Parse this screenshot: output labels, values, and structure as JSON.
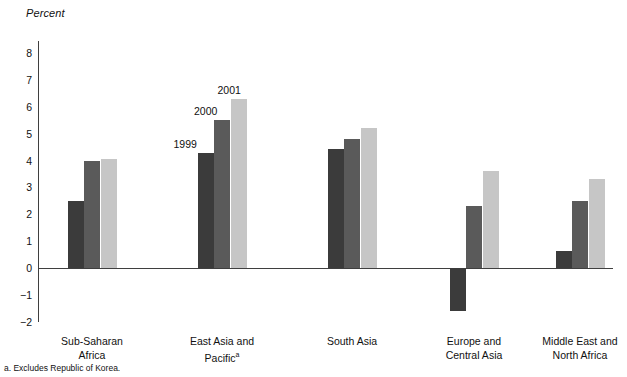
{
  "chart_data": {
    "type": "bar",
    "title": "",
    "ylabel": "Percent",
    "xlabel": "",
    "ylim": [
      -2,
      8
    ],
    "yticks": [
      8,
      7,
      6,
      5,
      4,
      3,
      2,
      1,
      0,
      -1,
      -2
    ],
    "ytick_labels": [
      "8",
      "7",
      "6",
      "5",
      "4",
      "3",
      "2",
      "1",
      "0",
      "−1",
      "−2"
    ],
    "grid": false,
    "legend_position": "inline-callout",
    "categories": [
      "Sub-Saharan Africa",
      "East Asia and Pacific",
      "South Asia",
      "Europe and Central Asia",
      "Middle East and North Africa"
    ],
    "category_lines": [
      [
        "Sub-Saharan",
        "Africa"
      ],
      [
        "East Asia and",
        "Pacific"
      ],
      [
        "South Asia",
        ""
      ],
      [
        "Europe and",
        "Central Asia"
      ],
      [
        "Middle East and",
        "North Africa"
      ]
    ],
    "series": [
      {
        "name": "1999",
        "color": "#3b3b3b",
        "values": [
          2.5,
          4.3,
          4.45,
          -1.6,
          0.65
        ]
      },
      {
        "name": "2000",
        "color": "#5a5a5a",
        "values": [
          4.0,
          5.5,
          4.8,
          2.3,
          2.5
        ]
      },
      {
        "name": "2001",
        "color": "#c6c6c6",
        "values": [
          4.05,
          6.3,
          5.2,
          3.6,
          3.3
        ]
      }
    ],
    "annotations": [
      {
        "text": "1999",
        "series": "1999",
        "category": "East Asia and Pacific"
      },
      {
        "text": "2000",
        "series": "2000",
        "category": "East Asia and Pacific"
      },
      {
        "text": "2001",
        "series": "2001",
        "category": "East Asia and Pacific"
      }
    ]
  },
  "footnote": "a. Excludes Republic of Korea.",
  "footnote_marker": "a"
}
